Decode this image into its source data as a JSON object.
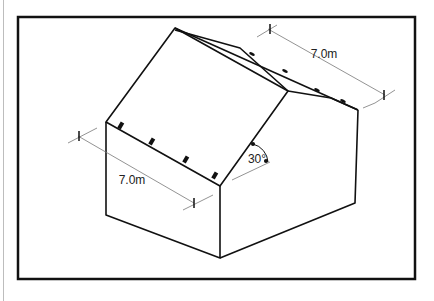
{
  "figure": {
    "annotations": {
      "ridge_length": "7.0m",
      "eave_length": "7.0m",
      "roof_pitch": "30°"
    },
    "colors": {
      "line": "#111111",
      "dimension_line": "#777777",
      "background": "#ffffff"
    }
  }
}
